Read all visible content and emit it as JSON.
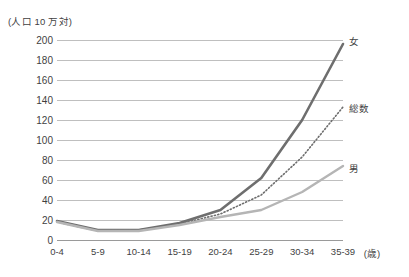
{
  "chart_data": {
    "type": "line",
    "title": "",
    "xlabel": "(歳)",
    "ylabel": "(人口 10 万対)",
    "categories": [
      "0-4",
      "5-9",
      "10-14",
      "15-19",
      "20-24",
      "25-29",
      "30-34",
      "35-39"
    ],
    "ylim": [
      0,
      200
    ],
    "ytick_step": 20,
    "yticks": [
      200,
      180,
      160,
      140,
      120,
      100,
      80,
      60,
      40,
      20,
      0
    ],
    "grid": true,
    "legend_position": "inline-right",
    "series": [
      {
        "name": "女",
        "label": "女",
        "style": "solid",
        "color": "#6e6e6e",
        "width": 2.6,
        "values": [
          19,
          10,
          10,
          17,
          30,
          62,
          120,
          196
        ]
      },
      {
        "name": "総数",
        "label": "総数",
        "style": "dotted",
        "color": "#6e6e6e",
        "width": 1.6,
        "values": [
          18,
          9,
          10,
          16,
          26,
          45,
          83,
          133
        ]
      },
      {
        "name": "男",
        "label": "男",
        "style": "solid",
        "color": "#b5b5b5",
        "width": 2.4,
        "values": [
          18,
          9,
          9,
          15,
          23,
          30,
          48,
          74
        ]
      }
    ]
  },
  "axis_unit": {
    "y": "(人口 10 万対)",
    "x": "(歳)"
  }
}
